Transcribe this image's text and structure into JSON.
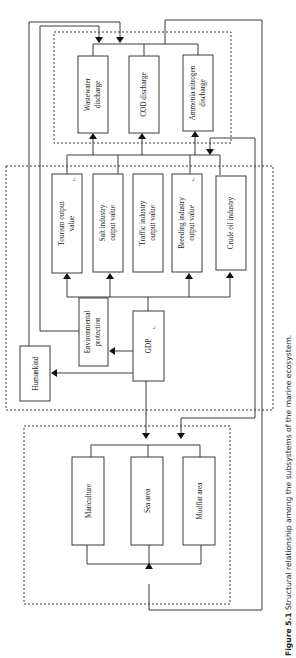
{
  "figure": {
    "caption_number": "Figure 5.1",
    "caption_text": "Structural relationship among the subsystems of the marine ecosystem.",
    "orientation": "rotated 90° counter-clockwise"
  },
  "subsystems": {
    "pollution": {
      "nodes": [
        {
          "id": "wastewater",
          "line1": "Wastewater",
          "line2": "discharge"
        },
        {
          "id": "cod",
          "line1": "COD discharge",
          "line2": ""
        },
        {
          "id": "ammonia",
          "line1": "Ammonia nitrogen",
          "line2": "discharge"
        }
      ]
    },
    "economy": {
      "nodes": [
        {
          "id": "tourism",
          "line1": "Tourism output",
          "line2": "value"
        },
        {
          "id": "salt",
          "line1": "Salt industry",
          "line2": "output value"
        },
        {
          "id": "traffic",
          "line1": "Traffic industry",
          "line2": "output value"
        },
        {
          "id": "breeding",
          "line1": "Breeding industry",
          "line2": "output value"
        },
        {
          "id": "crude",
          "line1": "Crude oil industry",
          "line2": ""
        },
        {
          "id": "env",
          "line1": "Environmental",
          "line2": "protection"
        },
        {
          "id": "gdp",
          "line1": "GDP",
          "line2": ""
        },
        {
          "id": "humankind",
          "line1": "Humankind",
          "line2": ""
        }
      ]
    },
    "resources": {
      "nodes": [
        {
          "id": "mariculture",
          "line1": "Mariculture",
          "line2": ""
        },
        {
          "id": "sea",
          "line1": "Sea area",
          "line2": ""
        },
        {
          "id": "mudflat",
          "line1": "Mudflat area",
          "line2": ""
        }
      ]
    }
  },
  "edges": [
    {
      "from": "GDP",
      "to": "Tourism output value"
    },
    {
      "from": "GDP",
      "to": "Salt industry output value"
    },
    {
      "from": "GDP",
      "to": "Breeding industry output value"
    },
    {
      "from": "GDP",
      "to": "Crude oil industry"
    },
    {
      "from": "GDP",
      "to": "Environmental protection"
    },
    {
      "from": "GDP",
      "to": "Humankind"
    },
    {
      "from": "GDP",
      "to": "Resources subsystem"
    },
    {
      "from": "Economy subsystem",
      "to": "Wastewater discharge"
    },
    {
      "from": "Economy subsystem",
      "to": "COD discharge"
    },
    {
      "from": "Economy subsystem",
      "to": "Ammonia nitrogen discharge"
    },
    {
      "from": "Humankind",
      "to": "Pollution subsystem"
    },
    {
      "from": "Environmental protection",
      "to": "Pollution subsystem"
    },
    {
      "from": "Pollution subsystem",
      "to": "Resources subsystem"
    },
    {
      "from": "Pollution subsystem",
      "to": "Economy subsystem"
    },
    {
      "from": "Resources subsystem",
      "to": "Resources subsystem"
    }
  ],
  "marks": {
    "superscript": "┘"
  }
}
